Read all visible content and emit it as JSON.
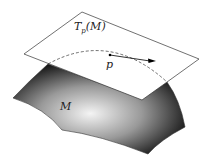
{
  "diagram": {
    "plane_label": "T",
    "plane_sub": "p",
    "plane_arg": "(M)",
    "point_label": "p",
    "manifold_label": "M"
  }
}
